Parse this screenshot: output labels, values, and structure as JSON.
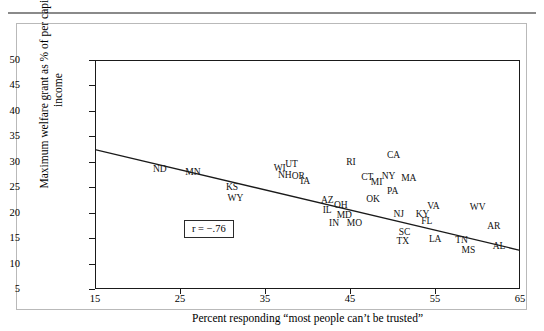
{
  "figure": {
    "correlation_label": "r = −.76"
  },
  "chart_data": {
    "type": "scatter",
    "title": "",
    "xlabel": "Percent responding “most people can’t be trusted”",
    "ylabel": "Maximum welfare grant as % of per capita income",
    "xlim": [
      15,
      65
    ],
    "ylim": [
      5,
      50
    ],
    "xticks": [
      15,
      25,
      35,
      45,
      55,
      65
    ],
    "yticks": [
      5,
      10,
      15,
      20,
      25,
      30,
      35,
      40,
      45,
      50
    ],
    "grid": false,
    "legend": null,
    "annotations": [
      "r = −.76"
    ],
    "correlation": -0.76,
    "point_style": "state-abbreviation-text",
    "trendline": {
      "type": "linear",
      "x_start": 15,
      "y_start": 32.4,
      "x_end": 65,
      "y_end": 12.6
    },
    "points": [
      {
        "label": "ND",
        "x": 22.5,
        "y": 28.6
      },
      {
        "label": "MN",
        "x": 26.4,
        "y": 28.0
      },
      {
        "label": "KS",
        "x": 31.0,
        "y": 25.0
      },
      {
        "label": "WY",
        "x": 31.4,
        "y": 22.8
      },
      {
        "label": "WI",
        "x": 36.6,
        "y": 28.8
      },
      {
        "label": "UT",
        "x": 38.0,
        "y": 29.6
      },
      {
        "label": "NH",
        "x": 37.2,
        "y": 27.5
      },
      {
        "label": "OR",
        "x": 38.8,
        "y": 27.3
      },
      {
        "label": "IA",
        "x": 39.6,
        "y": 26.2
      },
      {
        "label": "RI",
        "x": 45.0,
        "y": 30.0
      },
      {
        "label": "CA",
        "x": 50.0,
        "y": 31.4
      },
      {
        "label": "CT",
        "x": 46.9,
        "y": 27.0
      },
      {
        "label": "NY",
        "x": 49.4,
        "y": 27.3
      },
      {
        "label": "MA",
        "x": 51.8,
        "y": 26.9
      },
      {
        "label": "MI",
        "x": 48.0,
        "y": 26.0
      },
      {
        "label": "PA",
        "x": 49.9,
        "y": 24.2
      },
      {
        "label": "AZ",
        "x": 42.2,
        "y": 22.5
      },
      {
        "label": "OK",
        "x": 47.6,
        "y": 22.6
      },
      {
        "label": "IL",
        "x": 42.2,
        "y": 20.6
      },
      {
        "label": "OH",
        "x": 43.8,
        "y": 21.5
      },
      {
        "label": "MD",
        "x": 44.2,
        "y": 19.6
      },
      {
        "label": "IN",
        "x": 43.0,
        "y": 18.0
      },
      {
        "label": "MO",
        "x": 45.4,
        "y": 18.0
      },
      {
        "label": "NJ",
        "x": 50.6,
        "y": 19.8
      },
      {
        "label": "KY",
        "x": 53.4,
        "y": 19.7
      },
      {
        "label": "VA",
        "x": 54.7,
        "y": 21.4
      },
      {
        "label": "FL",
        "x": 53.9,
        "y": 18.4
      },
      {
        "label": "SC",
        "x": 51.3,
        "y": 16.2
      },
      {
        "label": "TX",
        "x": 51.1,
        "y": 14.5
      },
      {
        "label": "LA",
        "x": 54.9,
        "y": 14.8
      },
      {
        "label": "TN",
        "x": 58.0,
        "y": 14.6
      },
      {
        "label": "MS",
        "x": 58.8,
        "y": 12.7
      },
      {
        "label": "WV",
        "x": 59.9,
        "y": 21.2
      },
      {
        "label": "AR",
        "x": 61.8,
        "y": 17.3
      },
      {
        "label": "AL",
        "x": 62.4,
        "y": 13.4
      }
    ]
  }
}
